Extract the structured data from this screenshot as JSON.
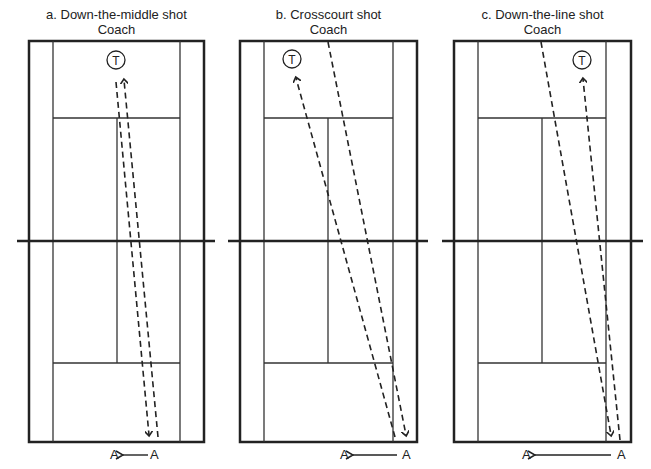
{
  "panels": [
    {
      "id": "a",
      "title": "a. Down-the-middle shot",
      "coach_label": "Coach",
      "target_label": "T",
      "player_from": "A",
      "player_to": "A",
      "court": {
        "left": 29,
        "right": 204,
        "top": 41,
        "bottom": 442,
        "singles_left": 53,
        "singles_right": 180,
        "center_x": 117
      },
      "target": {
        "x": 116,
        "y": 60
      },
      "shot_in": {
        "x1": 158,
        "y1": 437,
        "x2": 124,
        "y2": 80,
        "arrow": "start"
      },
      "shot_out": {
        "x1": 116,
        "y1": 82,
        "x2": 149,
        "y2": 435,
        "arrow": "end"
      },
      "player_labels": {
        "left_x": 110,
        "right_x": 150,
        "y": 448,
        "arrow_from": 148,
        "arrow_to": 123
      }
    },
    {
      "id": "b",
      "title": "b. Crosscourt shot",
      "coach_label": "Coach",
      "target_label": "T",
      "player_from": "A",
      "player_to": "A",
      "court": {
        "left": 240,
        "right": 417,
        "top": 41,
        "bottom": 442,
        "singles_left": 264,
        "singles_right": 393,
        "center_x": 328
      },
      "target": {
        "x": 292,
        "y": 59
      },
      "shot_in": {
        "x1": 395,
        "y1": 437,
        "x2": 296,
        "y2": 78,
        "arrow": "end"
      },
      "shot_out": {
        "x1": 328,
        "y1": 42,
        "x2": 406,
        "y2": 435,
        "arrow": "end"
      },
      "player_labels": {
        "left_x": 340,
        "right_x": 402,
        "y": 448,
        "arrow_from": 397,
        "arrow_to": 353
      }
    },
    {
      "id": "c",
      "title": "c. Down-the-line shot",
      "coach_label": "Coach",
      "target_label": "T",
      "player_from": "A",
      "player_to": "A",
      "court": {
        "left": 454,
        "right": 631,
        "top": 41,
        "bottom": 442,
        "singles_left": 478,
        "singles_right": 606,
        "center_x": 542
      },
      "target": {
        "x": 582,
        "y": 60
      },
      "shot_in": {
        "x1": 620,
        "y1": 440,
        "x2": 583,
        "y2": 79,
        "arrow": "end"
      },
      "shot_out": {
        "x1": 541,
        "y1": 42,
        "x2": 611,
        "y2": 435,
        "arrow": "end"
      },
      "player_labels": {
        "left_x": 522,
        "right_x": 617,
        "y": 448,
        "arrow_from": 611,
        "arrow_to": 535
      }
    }
  ],
  "net": {
    "y": 241,
    "segments": [
      [
        17,
        215
      ],
      [
        228,
        428
      ],
      [
        442,
        643
      ]
    ]
  },
  "service_lines": {
    "top_y": 118,
    "bottom_y": 363
  }
}
